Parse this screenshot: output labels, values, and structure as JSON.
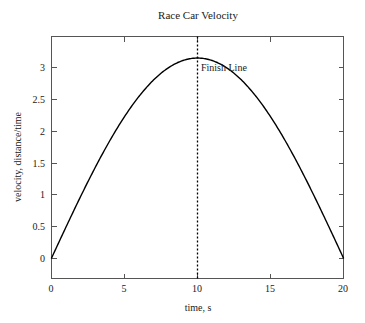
{
  "chart_data": {
    "type": "line",
    "title": "Race Car Velocity",
    "xlabel": "time, s",
    "ylabel": "velocity, distance/time",
    "xlim": [
      0,
      20
    ],
    "ylim": [
      -0.32,
      3.48
    ],
    "xticks": [
      0,
      5,
      10,
      15,
      20
    ],
    "xticklabels": [
      "0",
      "5",
      "10",
      "15",
      "20"
    ],
    "yticks": [
      0,
      0.5,
      1,
      1.5,
      2,
      2.5,
      3
    ],
    "yticklabels": [
      "0",
      "0.5",
      "1",
      "1.5",
      "2",
      "2.5",
      "3"
    ],
    "grid": false,
    "legend": null,
    "series": [
      {
        "name": "velocity",
        "color": "#000000",
        "x": [
          0,
          0.5,
          1,
          1.5,
          2,
          2.5,
          3,
          3.5,
          4,
          4.5,
          5,
          5.5,
          6,
          6.5,
          7,
          7.5,
          8,
          8.5,
          9,
          9.5,
          10,
          10.5,
          11,
          11.5,
          12,
          12.5,
          13,
          13.5,
          14,
          14.5,
          15,
          15.5,
          16,
          16.5,
          17,
          17.5,
          18,
          18.5,
          19,
          19.5,
          20
        ],
        "y": [
          0,
          0.246,
          0.489,
          0.727,
          0.957,
          1.177,
          1.385,
          1.579,
          1.757,
          1.917,
          2.059,
          2.18,
          2.28,
          2.357,
          2.412,
          2.443,
          2.45,
          2.434,
          2.394,
          2.33,
          3.142,
          3.131,
          3.1,
          3.048,
          2.976,
          2.884,
          2.773,
          2.644,
          2.497,
          2.334,
          2.156,
          1.963,
          1.757,
          1.54,
          1.313,
          1.078,
          0.837,
          0.591,
          0.342,
          0.091,
          0
        ],
        "equation": "3.1416 * sin(pi * t / 20)"
      }
    ],
    "annotations": [
      {
        "name": "finish-line",
        "label": "Finish Line",
        "x": 10,
        "type": "vertical-dotted-line",
        "color": "#000000"
      }
    ]
  },
  "colors": {
    "background": "#ffffff",
    "axis": "#555555",
    "curve": "#000000",
    "text": "#1a1a1a"
  }
}
